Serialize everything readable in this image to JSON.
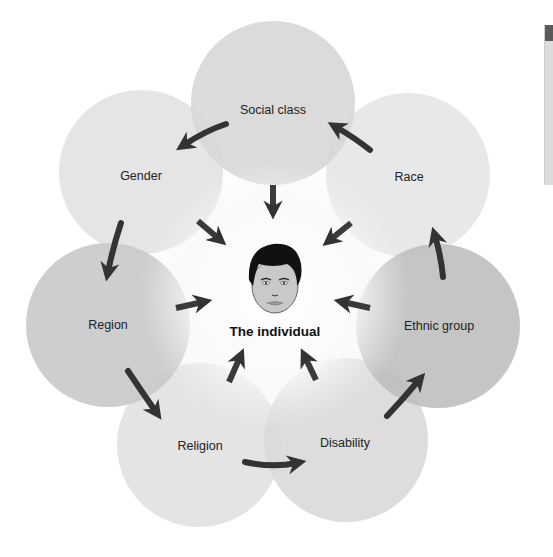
{
  "diagram": {
    "center": {
      "label": "The individual",
      "icon": "face-icon"
    },
    "factors": [
      {
        "id": "social-class",
        "label": "Social class",
        "cx": 273,
        "cy": 103,
        "fill": "#d7d7d7"
      },
      {
        "id": "race",
        "label": "Race",
        "cx": 408,
        "cy": 175,
        "fill": "#e6e6e6"
      },
      {
        "id": "ethnic-group",
        "label": "Ethnic group",
        "cx": 438,
        "cy": 326,
        "fill": "#bdbdbd"
      },
      {
        "id": "disability",
        "label": "Disability",
        "cx": 346,
        "cy": 440,
        "fill": "#d9d9d9"
      },
      {
        "id": "religion",
        "label": "Religion",
        "cx": 199,
        "cy": 445,
        "fill": "#e2e2e2"
      },
      {
        "id": "region",
        "label": "Region",
        "cx": 108,
        "cy": 325,
        "fill": "#c9c9c9"
      },
      {
        "id": "gender",
        "label": "Gender",
        "cx": 141,
        "cy": 172,
        "fill": "#e3e3e3"
      }
    ],
    "colors": {
      "arrow": "#333333",
      "background": "#ffffff",
      "center_glow": "#ffffff"
    }
  },
  "side_panel": {
    "icon": "panel-edge"
  }
}
